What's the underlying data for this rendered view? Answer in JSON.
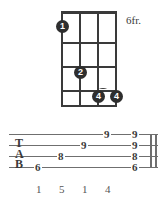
{
  "colors": {
    "ink": "#3a3a3a",
    "staff": "#6f6f6f",
    "dot_fill": "#2e2e2e",
    "dot_text": "#ffffff",
    "background": "#ffffff"
  },
  "chord_diagram": {
    "fret_position_label": "6fr.",
    "string_count": 4,
    "fret_count": 4,
    "has_nut": true,
    "barre": {
      "present": true,
      "fret": 3,
      "from_string": 3,
      "to_string": 4
    },
    "dots": [
      {
        "label": "1",
        "string": 1,
        "fret": 1
      },
      {
        "label": "2",
        "string": 2,
        "fret": 3
      },
      {
        "label": "4",
        "string": 3,
        "fret": 4
      },
      {
        "label": "4",
        "string": 4,
        "fret": 4
      }
    ]
  },
  "tablature": {
    "clef_letters": [
      "T",
      "A",
      "B"
    ],
    "line_count": 4,
    "end_barline": "double",
    "notes": [
      {
        "value": "6",
        "string": 4,
        "position": 0
      },
      {
        "value": "8",
        "string": 3,
        "position": 1
      },
      {
        "value": "9",
        "string": 2,
        "position": 2
      },
      {
        "value": "9",
        "string": 1,
        "position": 3
      },
      {
        "value": "9",
        "string": 1,
        "position": 4
      },
      {
        "value": "9",
        "string": 2,
        "position": 4
      },
      {
        "value": "8",
        "string": 3,
        "position": 4
      },
      {
        "value": "6",
        "string": 4,
        "position": 4
      }
    ]
  },
  "fingering": {
    "numbers": [
      "1",
      "5",
      "1",
      "4"
    ]
  }
}
